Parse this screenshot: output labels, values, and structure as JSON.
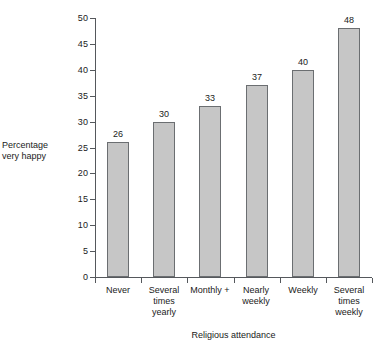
{
  "chart_data": {
    "type": "bar",
    "title": "",
    "xlabel": "Religious attendance",
    "ylabel": "Percentage very happy",
    "ylabel_lines": [
      "Percentage",
      "very happy"
    ],
    "categories": [
      "Never",
      "Several times yearly",
      "Monthly +",
      "Nearly weekly",
      "Weekly",
      "Several times weekly"
    ],
    "category_lines": [
      [
        "Never"
      ],
      [
        "Several",
        "times",
        "yearly"
      ],
      [
        "Monthly +"
      ],
      [
        "Nearly",
        "weekly"
      ],
      [
        "Weekly"
      ],
      [
        "Several",
        "times",
        "weekly"
      ]
    ],
    "values": [
      26,
      30,
      33,
      37,
      40,
      48
    ],
    "value_labels": [
      "26",
      "30",
      "33",
      "37",
      "40",
      "48"
    ],
    "ylim": [
      0,
      50
    ],
    "y_ticks": [
      0,
      5,
      10,
      15,
      20,
      25,
      30,
      35,
      40,
      45,
      50
    ],
    "y_tick_labels": [
      "0",
      "5",
      "10",
      "15",
      "20",
      "25",
      "30",
      "35",
      "40",
      "45",
      "50"
    ],
    "grid": false,
    "legend": false,
    "bar_fill_color": "#c6c6c6",
    "bar_edge_color": "#6b6e71",
    "axis_color": "#55585c",
    "text_color": "#1a1a1a"
  }
}
